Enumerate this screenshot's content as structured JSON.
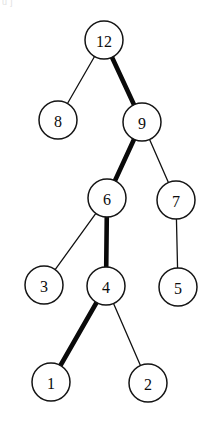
{
  "figure": {
    "clipped_header_text": "u j",
    "background_color": "#ffffff",
    "node_fill": "#ffffff",
    "node_stroke": "#141414",
    "edge_color": "#111111",
    "bold_edge_color": "#0a0a0a"
  },
  "chart_data": {
    "type": "diagram",
    "subtype": "binary-tree",
    "nodes": [
      {
        "id": "n12",
        "label": "12",
        "x": 104,
        "y": 40,
        "r": 19,
        "level": 0
      },
      {
        "id": "n8",
        "label": "8",
        "x": 58,
        "y": 120,
        "r": 19,
        "level": 1
      },
      {
        "id": "n9",
        "label": "9",
        "x": 142,
        "y": 122,
        "r": 19,
        "level": 1
      },
      {
        "id": "n6",
        "label": "6",
        "x": 107,
        "y": 198,
        "r": 19,
        "level": 2
      },
      {
        "id": "n7",
        "label": "7",
        "x": 176,
        "y": 200,
        "r": 19,
        "level": 2
      },
      {
        "id": "n3",
        "label": "3",
        "x": 44,
        "y": 285,
        "r": 19,
        "level": 3
      },
      {
        "id": "n4",
        "label": "4",
        "x": 106,
        "y": 286,
        "r": 19,
        "level": 3
      },
      {
        "id": "n5",
        "label": "5",
        "x": 178,
        "y": 287,
        "r": 19,
        "level": 3
      },
      {
        "id": "n1",
        "label": "1",
        "x": 51,
        "y": 382,
        "r": 19,
        "level": 4
      },
      {
        "id": "n2",
        "label": "2",
        "x": 148,
        "y": 383,
        "r": 19,
        "level": 4
      }
    ],
    "edges": [
      {
        "from": "n12",
        "to": "n8",
        "weight": "thin"
      },
      {
        "from": "n12",
        "to": "n9",
        "weight": "bold"
      },
      {
        "from": "n9",
        "to": "n6",
        "weight": "bold"
      },
      {
        "from": "n9",
        "to": "n7",
        "weight": "thin"
      },
      {
        "from": "n6",
        "to": "n3",
        "weight": "thin"
      },
      {
        "from": "n6",
        "to": "n4",
        "weight": "bold"
      },
      {
        "from": "n7",
        "to": "n5",
        "weight": "thin"
      },
      {
        "from": "n4",
        "to": "n1",
        "weight": "bold"
      },
      {
        "from": "n4",
        "to": "n2",
        "weight": "thin"
      }
    ],
    "highlighted_path": [
      "12",
      "9",
      "6",
      "4",
      "1"
    ],
    "node_values": [
      12,
      8,
      9,
      6,
      7,
      3,
      4,
      5,
      1,
      2
    ]
  }
}
